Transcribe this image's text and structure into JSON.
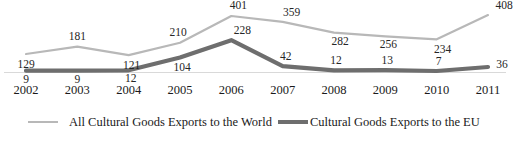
{
  "chart_data": {
    "type": "line",
    "title": "",
    "subtitle": "",
    "xlabel": "",
    "ylabel": "",
    "grid": false,
    "legend_position": "bottom",
    "ylim": [
      0,
      430
    ],
    "categories": [
      "2002",
      "2003",
      "2004",
      "2005",
      "2006",
      "2007",
      "2008",
      "2009",
      "2010",
      "2011"
    ],
    "series": [
      {
        "name": "All Cultural Goods Exports to the World",
        "color": "#b8b8b8",
        "values": [
          129,
          181,
          121,
          210,
          401,
          359,
          282,
          256,
          234,
          408
        ]
      },
      {
        "name": "Cultural Goods Exports to the EU",
        "color": "#6e6e6e",
        "values": [
          9,
          9,
          12,
          104,
          228,
          42,
          12,
          13,
          7,
          36
        ]
      }
    ]
  },
  "axis": {
    "x_tick_labels": [
      "2002",
      "2003",
      "2004",
      "2005",
      "2006",
      "2007",
      "2008",
      "2009",
      "2010",
      "2011"
    ]
  },
  "data_labels": {
    "world": [
      "129",
      "181",
      "121",
      "210",
      "401",
      "359",
      "282",
      "256",
      "234",
      "408"
    ],
    "eu": [
      "9",
      "9",
      "12",
      "104",
      "228",
      "42",
      "12",
      "13",
      "7",
      "36"
    ]
  },
  "legend": {
    "items": [
      {
        "label": "All Cultural Goods Exports to the World",
        "color": "#b8b8b8"
      },
      {
        "label": "Cultural Goods Exports to the EU",
        "color": "#6e6e6e"
      }
    ]
  },
  "colors": {
    "background": "#ffffff",
    "world_line": "#b8b8b8",
    "eu_line": "#6e6e6e",
    "baseline": "#d9d9d9",
    "text": "#1a1a1a"
  }
}
